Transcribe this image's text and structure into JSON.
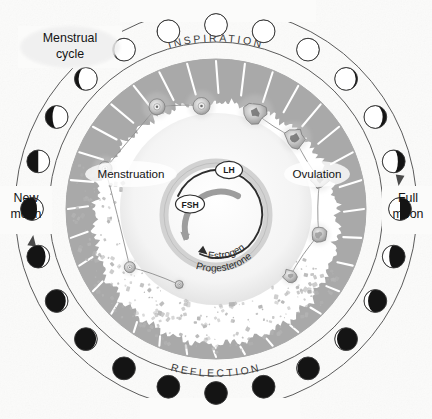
{
  "diagram": {
    "title_label": "Menstrual cycle",
    "top_arc_label": "INSPIRATION",
    "bottom_arc_label": "REFLECTION",
    "left_moon_label_line1": "New",
    "left_moon_label_line2": "moon",
    "right_moon_label_line1": "Full",
    "right_moon_label_line2": "moon",
    "phase_left_label": "Menstruation",
    "phase_right_label": "Ovulation",
    "hormones": {
      "lh": "LH",
      "fsh": "FSH",
      "estrogen": "Estrogen",
      "progesterone": "Progesterone"
    },
    "colors": {
      "endometrium_gray": "#a9a9a9",
      "moon_dark": "#141414",
      "moon_light": "#ffffff",
      "outline": "#4a4a4a",
      "background": "#fbfbfa",
      "text": "#1a1a1a"
    },
    "moon_phases": [
      {
        "index": 0,
        "name": "new-moon",
        "angle": 180,
        "illum": 0.0,
        "lit_side": "right"
      },
      {
        "index": 1,
        "name": "waxing-crescent-1",
        "angle": 195,
        "illum": 0.0,
        "lit_side": "right"
      },
      {
        "index": 2,
        "name": "waxing-crescent-2",
        "angle": 210,
        "illum": 0.0,
        "lit_side": "right"
      },
      {
        "index": 3,
        "name": "waxing-crescent-3",
        "angle": 225,
        "illum": 0.05,
        "lit_side": "right"
      },
      {
        "index": 4,
        "name": "waxing-crescent-4",
        "angle": 240,
        "illum": 0.1,
        "lit_side": "right"
      },
      {
        "index": 5,
        "name": "waxing-crescent-5",
        "angle": 255,
        "illum": 0.18,
        "lit_side": "right"
      },
      {
        "index": 6,
        "name": "waxing-crescent-6",
        "angle": 270,
        "illum": 0.28,
        "lit_side": "right"
      },
      {
        "index": 7,
        "name": "first-quarter",
        "angle": 285,
        "illum": 0.5,
        "lit_side": "right"
      },
      {
        "index": 8,
        "name": "waxing-gibbous-1",
        "angle": 300,
        "illum": 0.68,
        "lit_side": "right"
      },
      {
        "index": 9,
        "name": "waxing-gibbous-2",
        "angle": 315,
        "illum": 0.82,
        "lit_side": "right"
      },
      {
        "index": 10,
        "name": "waxing-gibbous-3",
        "angle": 330,
        "illum": 0.92,
        "lit_side": "right"
      },
      {
        "index": 11,
        "name": "waxing-gibbous-4",
        "angle": 345,
        "illum": 0.98,
        "lit_side": "right"
      },
      {
        "index": 12,
        "name": "full-moon",
        "angle": 0,
        "illum": 1.0,
        "lit_side": "right"
      },
      {
        "index": 13,
        "name": "waning-gibbous-1",
        "angle": 15,
        "illum": 1.0,
        "lit_side": "left"
      },
      {
        "index": 14,
        "name": "waning-gibbous-2",
        "angle": 30,
        "illum": 0.98,
        "lit_side": "left"
      },
      {
        "index": 15,
        "name": "waning-gibbous-3",
        "angle": 45,
        "illum": 0.92,
        "lit_side": "left"
      },
      {
        "index": 16,
        "name": "waning-gibbous-4",
        "angle": 60,
        "illum": 0.82,
        "lit_side": "left"
      },
      {
        "index": 17,
        "name": "waning-gibbous-5",
        "angle": 75,
        "illum": 0.68,
        "lit_side": "left"
      },
      {
        "index": 18,
        "name": "last-quarter",
        "angle": 90,
        "illum": 0.5,
        "lit_side": "left"
      },
      {
        "index": 19,
        "name": "waning-crescent-1",
        "angle": 105,
        "illum": 0.3,
        "lit_side": "left"
      },
      {
        "index": 20,
        "name": "waning-crescent-2",
        "angle": 120,
        "illum": 0.18,
        "lit_side": "left"
      },
      {
        "index": 21,
        "name": "waning-crescent-3",
        "angle": 135,
        "illum": 0.1,
        "lit_side": "left"
      },
      {
        "index": 22,
        "name": "waning-crescent-4",
        "angle": 150,
        "illum": 0.04,
        "lit_side": "left"
      },
      {
        "index": 23,
        "name": "waning-crescent-5",
        "angle": 165,
        "illum": 0.0,
        "lit_side": "left"
      }
    ],
    "follicles": [
      {
        "index": 0,
        "name": "follicle-primordial",
        "r": 4.0
      },
      {
        "index": 1,
        "name": "follicle-primary",
        "r": 5.5
      },
      {
        "index": 2,
        "name": "follicle-secondary",
        "r": 7.0
      },
      {
        "index": 3,
        "name": "follicle-tertiary",
        "r": 8.0
      },
      {
        "index": 4,
        "name": "follicle-graafian",
        "r": 8.5
      }
    ],
    "luteal_bodies": [
      {
        "index": 0,
        "name": "corpus-luteum-early"
      },
      {
        "index": 1,
        "name": "corpus-luteum-mature"
      },
      {
        "index": 2,
        "name": "corpus-luteum-regressing"
      },
      {
        "index": 3,
        "name": "corpus-albicans"
      }
    ]
  }
}
